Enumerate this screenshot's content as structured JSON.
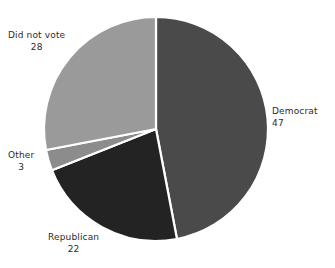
{
  "chart_data": {
    "type": "pie",
    "title": "",
    "subtitle": "",
    "xlabel": "",
    "ylabel": "",
    "legend_position": "none",
    "grid": false,
    "labels_outside": true,
    "start_angle_deg": 0,
    "direction": "clockwise",
    "categories": [
      "Democrat",
      "Republican",
      "Other",
      "Did not vote"
    ],
    "values": [
      47,
      22,
      3,
      28
    ],
    "total": 100,
    "slices": [
      {
        "label": "Democrat",
        "value": 47,
        "value_text": "47",
        "color": "#4a4a4a",
        "start_deg": 0,
        "end_deg": 169.2,
        "label_position": "right"
      },
      {
        "label": "Republican",
        "value": 22,
        "value_text": "22",
        "color": "#232323",
        "start_deg": 169.2,
        "end_deg": 248.4,
        "label_position": "bottom-left"
      },
      {
        "label": "Other",
        "value": 3,
        "value_text": "3",
        "color": "#8c8c8c",
        "start_deg": 248.4,
        "end_deg": 259.2,
        "label_position": "left"
      },
      {
        "label": "Did not vote",
        "value": 28,
        "value_text": "28",
        "color": "#9a9a9a",
        "start_deg": 259.2,
        "end_deg": 360,
        "label_position": "upper-left"
      }
    ],
    "geometry": {
      "center_x": 156,
      "center_y": 129,
      "radius": 112
    },
    "style": {
      "background": "#ffffff",
      "separator_color": "#ffffff",
      "text_color": "#2b2b2b"
    }
  },
  "labels": {
    "democrat": {
      "name": "Democrat",
      "value": "47"
    },
    "republican": {
      "name": "Republican",
      "value": "22"
    },
    "other": {
      "name": "Other",
      "value": "3"
    },
    "did_not_vote": {
      "name": "Did not vote",
      "value": "28"
    }
  }
}
